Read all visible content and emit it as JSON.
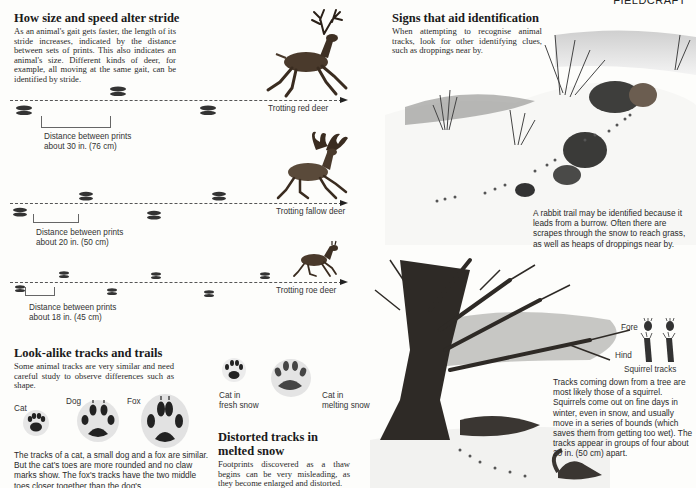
{
  "page": {
    "running_head": "FIELDCRAFT"
  },
  "stride": {
    "title": "How size and speed alter stride",
    "body": "As an animal's gait gets faster, the length of its stride increases, indicated by the distance between sets of prints. This also indicates an animal's size. Different kinds of deer, for example, all moving at the same gait, can be identified by stride.",
    "rows": [
      {
        "label": "Trotting red deer",
        "distance_line1": "Distance between prints",
        "distance_line2": "about 30 in. (76 cm)"
      },
      {
        "label": "Trotting fallow deer",
        "distance_line1": "Distance between prints",
        "distance_line2": "about 20 in. (50 cm)"
      },
      {
        "label": "Trotting roe deer",
        "distance_line1": "Distance between prints",
        "distance_line2": "about 18 in. (45 cm)"
      }
    ]
  },
  "lookalike": {
    "title": "Look-alike tracks and trails",
    "body": "Some animal tracks are very similar and need careful study to observe differences such as shape.",
    "labels": {
      "cat": "Cat",
      "dog": "Dog",
      "fox": "Fox"
    },
    "caption": "The tracks of a cat, a small dog and a fox are similar. But the cat's toes are more rounded and no claw marks show. The fox's tracks have the two middle toes closer together than the dog's."
  },
  "snow": {
    "fresh_label_1": "Cat in",
    "fresh_label_2": "fresh snow",
    "melting_label_1": "Cat in",
    "melting_label_2": "melting snow",
    "title_line1": "Distorted tracks in",
    "title_line2": "melted snow",
    "body": "Footprints discovered as a thaw begins can be very misleading, as they become enlarged and distorted."
  },
  "signs": {
    "title": "Signs that aid identification",
    "body": "When attempting to recognise animal tracks, look for other identifying clues, such as droppings near by.",
    "rabbit_caption": "A rabbit trail may be identified because it leads from a burrow. Often there are scrapes through the snow to reach grass, as well as heaps of droppings near by."
  },
  "squirrel": {
    "fore_label": "Fore",
    "hind_label": "Hind",
    "tracks_label": "Squirrel tracks",
    "caption": "Tracks coming down from a tree are most likely those of a squirrel. Squirrels come out on fine days in winter, even in snow, and usually move in a series of bounds (which saves them from getting too wet). The tracks appear in groups of four about 20 in. (50 cm) apart."
  }
}
